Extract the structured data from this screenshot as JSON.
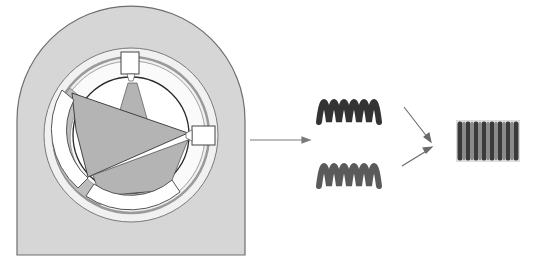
{
  "diagram": {
    "type": "mechanical-schematic",
    "panels": [
      {
        "id": "housing",
        "description": "Rounded housing with rotor cross-section, three spring blocks and gray sector wedges"
      },
      {
        "id": "spring-pair",
        "description": "Two open-coil springs (top and bottom)"
      },
      {
        "id": "combined-spring",
        "description": "Single dense-coil spring"
      }
    ],
    "arrows": [
      {
        "from": "housing",
        "to": "spring-pair"
      },
      {
        "from": "spring-pair.top",
        "to": "combined-spring"
      },
      {
        "from": "spring-pair.bottom",
        "to": "combined-spring"
      }
    ],
    "colors": {
      "housing_fill": "#d6d6d6",
      "housing_stroke": "#6e6e6e",
      "ring_fill": "#ececec",
      "sector_fill": "#b4b4b4",
      "block_fill": "#ffffff",
      "spring_dark": "#2e2e2e",
      "spring_mid": "#6a6a6a",
      "arrow": "#7a7a7a"
    }
  }
}
